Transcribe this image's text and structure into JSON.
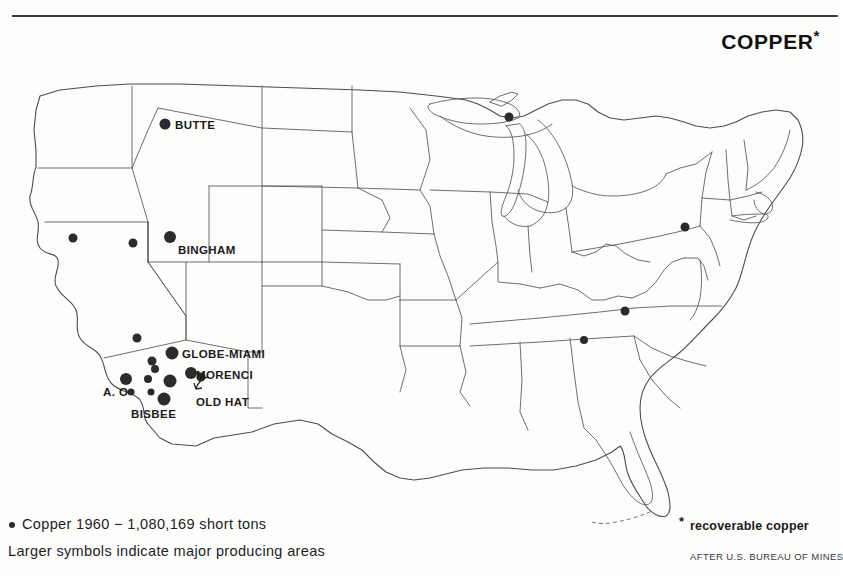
{
  "title": {
    "text": "COPPER",
    "footnote_marker": "*"
  },
  "legend": {
    "symbol_icon": "filled-circle-icon",
    "line1": "Copper 1960 − 1,080,169 short tons",
    "line2": "Larger symbols indicate major producing areas",
    "footnote_marker": "*",
    "footnote_text": "recoverable copper",
    "credit": "AFTER U.S. BUREAU OF MINES"
  },
  "map": {
    "type": "choropleth-free point map of the United States",
    "outline_color": "#5a5a5a",
    "symbol_color": "#2b2b2b",
    "background_color": "#fdfdfc",
    "labels": [
      {
        "text": "BUTTE",
        "x": 175,
        "y": 119
      },
      {
        "text": "BINGHAM",
        "x": 178,
        "y": 244
      },
      {
        "text": "GLOBE-MIAMI",
        "x": 182,
        "y": 348
      },
      {
        "text": "MORENCI",
        "x": 196,
        "y": 369
      },
      {
        "text": "OLD HAT",
        "x": 196,
        "y": 396
      },
      {
        "text": "A. O",
        "x": 103,
        "y": 386
      },
      {
        "text": "BISBEE",
        "x": 131,
        "y": 408
      }
    ],
    "symbols": [
      {
        "name": "butte-mine",
        "x": 165,
        "y": 124,
        "r": 5.5
      },
      {
        "name": "michigan-keweenaw-mine",
        "x": 509,
        "y": 117,
        "r": 4.5
      },
      {
        "name": "nevada-ely-mine",
        "x": 73,
        "y": 238,
        "r": 4.5
      },
      {
        "name": "utah-west-mine",
        "x": 133,
        "y": 243,
        "r": 4.5
      },
      {
        "name": "bingham-mine",
        "x": 170,
        "y": 237,
        "r": 6.0
      },
      {
        "name": "pennsylvania-mine",
        "x": 685,
        "y": 227,
        "r": 4.5
      },
      {
        "name": "tennessee-copperhill",
        "x": 625,
        "y": 311,
        "r": 4.5
      },
      {
        "name": "alabama-border-mine",
        "x": 584,
        "y": 340,
        "r": 4.0
      },
      {
        "name": "nevada-arizona-mine",
        "x": 137,
        "y": 338,
        "r": 4.5
      },
      {
        "name": "globe-miami-mine",
        "x": 172,
        "y": 353,
        "r": 6.5
      },
      {
        "name": "arizona-upper-mine-1",
        "x": 152,
        "y": 361,
        "r": 4.5
      },
      {
        "name": "arizona-upper-mine-2",
        "x": 155,
        "y": 369,
        "r": 4.0
      },
      {
        "name": "morenci-mine",
        "x": 191,
        "y": 373,
        "r": 6.0
      },
      {
        "name": "arizona-ajo-mine",
        "x": 126,
        "y": 379,
        "r": 6.0
      },
      {
        "name": "arizona-mid-mine",
        "x": 148,
        "y": 379,
        "r": 4.0
      },
      {
        "name": "arizona-ray-mine",
        "x": 170,
        "y": 381,
        "r": 6.5
      },
      {
        "name": "arizona-small-mine-1",
        "x": 131,
        "y": 392,
        "r": 3.5
      },
      {
        "name": "arizona-small-mine-2",
        "x": 151,
        "y": 392,
        "r": 3.5
      },
      {
        "name": "old-hat-mine",
        "x": 201,
        "y": 377,
        "r": 4.5
      },
      {
        "name": "bisbee-mine",
        "x": 164,
        "y": 399,
        "r": 6.5
      }
    ]
  }
}
